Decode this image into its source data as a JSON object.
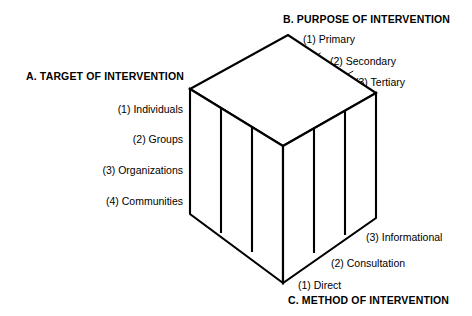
{
  "diagram": {
    "title_a": "A. TARGET OF INTERVENTION",
    "title_b": "B. PURPOSE OF INTERVENTION",
    "title_c": "C. METHOD OF INTERVENTION",
    "axis_a_labels": [
      "(1) Individuals",
      "(2) Groups",
      "(3) Organizations",
      "(4) Communities"
    ],
    "axis_b_labels": [
      "(1) Primary",
      "(2) Secondary",
      "(3) Tertiary"
    ],
    "axis_c_labels": [
      "(1) Direct",
      "(2) Consultation",
      "(3) Informational"
    ],
    "colors": {
      "line": "#000000",
      "face": "#ffffff",
      "text": "#000000"
    },
    "geometry": {
      "type": "isometric-cube-matrix",
      "rows_left_face": 4,
      "cols_left_face": 3,
      "rows_right_face": 4,
      "cols_right_face": 3,
      "top_face_grid": "3x3"
    }
  }
}
